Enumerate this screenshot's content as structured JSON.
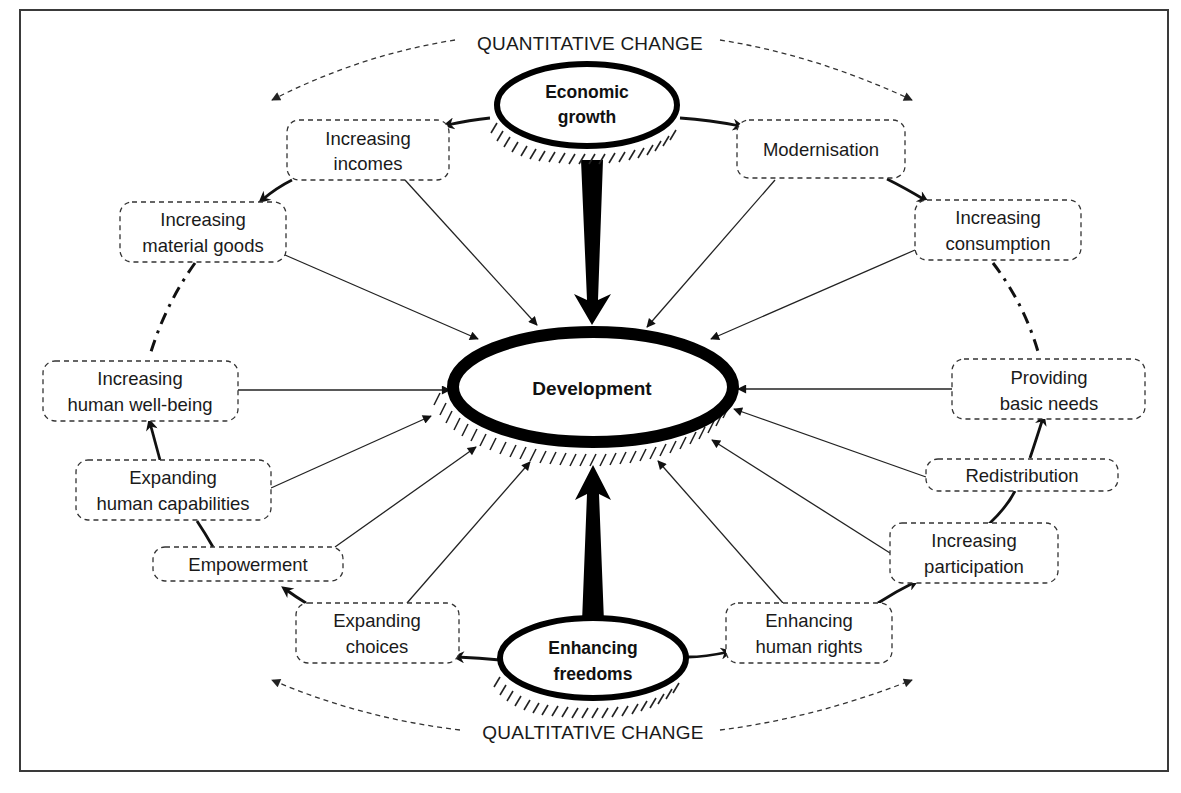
{
  "diagram": {
    "top_axis_label": "QUANTITATIVE CHANGE",
    "bottom_axis_label": "QUALTITATIVE CHANGE",
    "center": {
      "label": "Development"
    },
    "hubs": {
      "top": {
        "line1": "Economic",
        "line2": "growth"
      },
      "bottom": {
        "line1": "Enhancing",
        "line2": "freedoms"
      }
    },
    "nodes": {
      "increasing_incomes": {
        "line1": "Increasing",
        "line2": "incomes"
      },
      "modernisation": {
        "line1": "Modernisation"
      },
      "increasing_material_goods": {
        "line1": "Increasing",
        "line2": "material goods"
      },
      "increasing_consumption": {
        "line1": "Increasing",
        "line2": "consumption"
      },
      "increasing_human_well_being": {
        "line1": "Increasing",
        "line2": "human well-being"
      },
      "providing_basic_needs": {
        "line1": "Providing",
        "line2": "basic needs"
      },
      "expanding_human_capabilities": {
        "line1": "Expanding",
        "line2": "human capabilities"
      },
      "redistribution": {
        "line1": "Redistribution"
      },
      "empowerment": {
        "line1": "Empowerment"
      },
      "increasing_participation": {
        "line1": "Increasing",
        "line2": "participation"
      },
      "expanding_choices": {
        "line1": "Expanding",
        "line2": "choices"
      },
      "enhancing_human_rights": {
        "line1": "Enhancing",
        "line2": "human rights"
      }
    },
    "colors": {
      "stroke": "#000000",
      "text": "#1a1a1a",
      "background": "#ffffff",
      "frame": "#3a3a3a"
    }
  }
}
